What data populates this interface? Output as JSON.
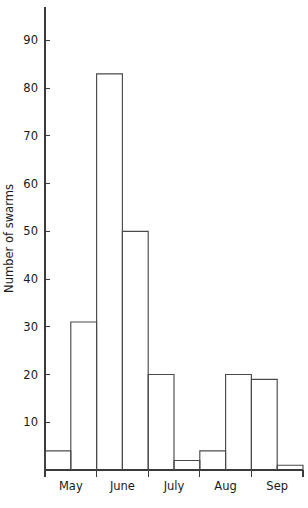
{
  "chart_data": {
    "type": "bar",
    "title": "",
    "subtitle": "",
    "xlabel": "",
    "ylabel": "Number of swarms",
    "categories": [
      "May (early)",
      "May (late)",
      "June (early)",
      "June (late)",
      "July (early)",
      "July (late)",
      "Aug (early)",
      "Aug (late)",
      "Sep (early)",
      "Sep (late)"
    ],
    "values": [
      4,
      31,
      83,
      50,
      20,
      2,
      4,
      20,
      19,
      1
    ],
    "ylim": [
      0,
      97
    ],
    "xlim": [
      0,
      10
    ],
    "grid": false,
    "legend": null,
    "y_ticks": [
      10,
      20,
      30,
      40,
      50,
      60,
      70,
      80,
      90
    ],
    "y_tick_labels": [
      "10",
      "20",
      "30",
      "40",
      "50",
      "60",
      "70",
      "80",
      "90"
    ],
    "x_tick_positions": [
      0,
      2,
      4,
      6,
      8,
      10
    ],
    "x_group_labels": [
      "May",
      "June",
      "July",
      "Aug",
      "Sep"
    ]
  },
  "axis": {
    "y_title": "Number of swarms"
  },
  "colors": {
    "bar_stroke": "#4a4a4a",
    "axis": "#3a3a3a",
    "background": "#ffffff",
    "text": "#1a1a1a"
  }
}
